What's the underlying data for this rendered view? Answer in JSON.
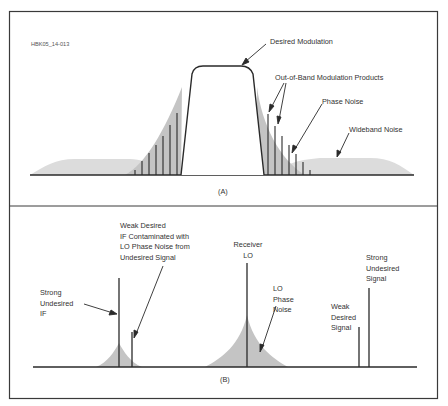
{
  "figure_id": "HBK05_14-013",
  "panel_a": {
    "caption": "(A)",
    "labels": {
      "desired_modulation": "Desired Modulation",
      "out_of_band": "Out-of-Band Modulation Products",
      "phase_noise": "Phase Noise",
      "wideband_noise": "Wideband Noise"
    }
  },
  "panel_b": {
    "caption": "(B)",
    "labels": {
      "strong_undesired_if": [
        "Strong",
        "Undesired",
        "IF"
      ],
      "weak_desired_if": [
        "Weak Desired",
        "IF Contaminated with",
        "LO Phase Noise from",
        "Undesired Signal"
      ],
      "receiver_lo": [
        "Receiver",
        "LO"
      ],
      "lo_phase_noise": [
        "LO",
        "Phase",
        "Noise"
      ],
      "weak_desired_signal": [
        "Weak",
        "Desired",
        "Signal"
      ],
      "strong_undesired_signal": [
        "Strong",
        "Undesired",
        "Signal"
      ]
    }
  },
  "colors": {
    "line": "#2a2a2a",
    "noise_fill": "#c8c8c8",
    "border": "#3a3a3a"
  }
}
